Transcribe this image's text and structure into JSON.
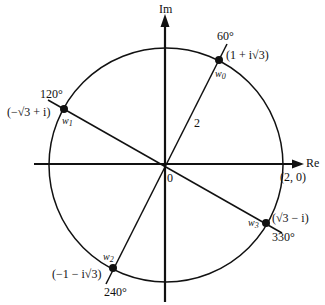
{
  "diagram": {
    "colors": {
      "ink": "#111111",
      "background": "#ffffff"
    },
    "axes": {
      "real_label": "Re",
      "imag_label": "Im",
      "origin_label": "0",
      "real_intercept_label": "(2, 0)"
    },
    "radius_label": "2",
    "roots": [
      {
        "name": "w",
        "sub": "0",
        "angle_label": "60°",
        "value_label": "(1 + i√3)"
      },
      {
        "name": "w",
        "sub": "1",
        "angle_label": "120°",
        "value_label": "(−√3 + i)"
      },
      {
        "name": "w",
        "sub": "2",
        "angle_label": "240°",
        "value_label": "(−1 − i√3)"
      },
      {
        "name": "w",
        "sub": "3",
        "angle_label": "330°",
        "value_label": "(√3 − i)"
      }
    ]
  }
}
